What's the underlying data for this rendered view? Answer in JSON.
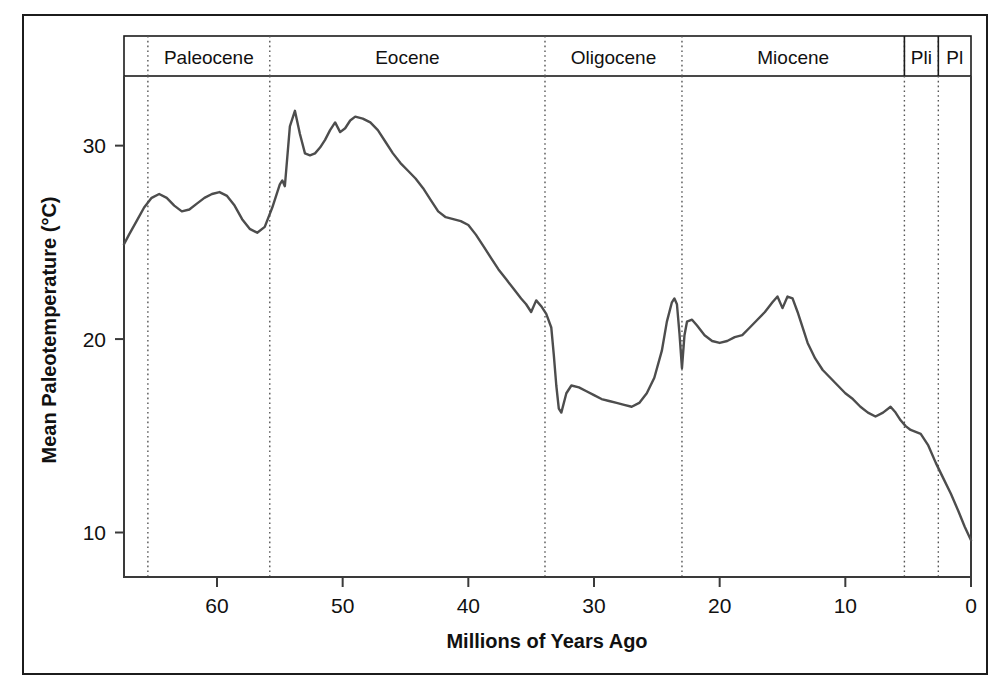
{
  "figure": {
    "background_color": "#ffffff",
    "frame_color": "#1c1c1c",
    "curve_color": "#4d4d4d",
    "axis_color": "#3a3a3a"
  },
  "chart_data": {
    "type": "line",
    "title": "",
    "xlabel": "Millions of Years Ago",
    "ylabel": "Mean Paleotemperature (°C)",
    "xlim": [
      67.4,
      0
    ],
    "ylim": [
      7.7,
      33.6
    ],
    "x_reversed": true,
    "grid": false,
    "legend": "none",
    "xticks": [
      60,
      50,
      40,
      30,
      20,
      10,
      0
    ],
    "xtick_labels": [
      "60",
      "50",
      "40",
      "30",
      "20",
      "10",
      "0"
    ],
    "yticks": [
      30,
      20,
      10
    ],
    "ytick_labels": [
      "30",
      "20",
      "10"
    ],
    "series": [
      {
        "name": "Mean Paleotemperature",
        "color": "#4d4d4d",
        "x": [
          67.4,
          67.0,
          66.4,
          65.8,
          65.2,
          64.6,
          64.0,
          63.4,
          62.8,
          62.2,
          61.6,
          61.0,
          60.4,
          59.8,
          59.2,
          58.6,
          58.0,
          57.4,
          56.8,
          56.2,
          55.6,
          55.2,
          55.0,
          54.8,
          54.6,
          54.2,
          53.8,
          53.4,
          53.0,
          52.6,
          52.2,
          51.8,
          51.4,
          51.0,
          50.6,
          50.2,
          49.8,
          49.4,
          49.0,
          48.4,
          47.8,
          47.2,
          46.6,
          46.0,
          45.4,
          44.8,
          44.2,
          43.6,
          43.0,
          42.4,
          41.8,
          41.2,
          40.6,
          40.0,
          39.4,
          38.8,
          38.2,
          37.6,
          37.0,
          36.4,
          35.8,
          35.4,
          35.0,
          34.6,
          34.2,
          33.8,
          33.4,
          33.2,
          33.0,
          32.8,
          32.6,
          32.2,
          31.8,
          31.2,
          30.6,
          30.0,
          29.4,
          28.8,
          28.2,
          27.6,
          27.0,
          26.4,
          25.8,
          25.2,
          24.6,
          24.2,
          23.8,
          23.6,
          23.4,
          23.2,
          23.0,
          22.8,
          22.6,
          22.2,
          21.8,
          21.2,
          20.6,
          20.0,
          19.4,
          18.8,
          18.2,
          17.6,
          17.0,
          16.4,
          15.8,
          15.4,
          15.0,
          14.6,
          14.2,
          13.8,
          13.4,
          13.0,
          12.4,
          11.8,
          11.2,
          10.6,
          10.0,
          9.4,
          8.8,
          8.2,
          7.6,
          7.0,
          6.4,
          6.0,
          5.6,
          5.2,
          4.8,
          4.4,
          4.0,
          3.4,
          2.8,
          2.2,
          1.6,
          1.0,
          0.5,
          0.0
        ],
        "y": [
          24.9,
          25.4,
          26.1,
          26.8,
          27.3,
          27.5,
          27.3,
          26.9,
          26.6,
          26.7,
          27.0,
          27.3,
          27.5,
          27.6,
          27.4,
          26.9,
          26.2,
          25.7,
          25.5,
          25.8,
          26.8,
          27.6,
          28.0,
          28.2,
          27.9,
          31.0,
          31.8,
          30.6,
          29.6,
          29.5,
          29.6,
          29.9,
          30.3,
          30.8,
          31.2,
          30.7,
          30.9,
          31.3,
          31.5,
          31.4,
          31.2,
          30.8,
          30.2,
          29.6,
          29.1,
          28.7,
          28.3,
          27.8,
          27.2,
          26.6,
          26.3,
          26.2,
          26.1,
          25.9,
          25.4,
          24.8,
          24.2,
          23.6,
          23.1,
          22.6,
          22.1,
          21.8,
          21.4,
          22.0,
          21.7,
          21.3,
          20.6,
          19.2,
          17.6,
          16.4,
          16.2,
          17.2,
          17.6,
          17.5,
          17.3,
          17.1,
          16.9,
          16.8,
          16.7,
          16.6,
          16.5,
          16.7,
          17.2,
          18.0,
          19.4,
          20.9,
          21.9,
          22.1,
          21.8,
          20.3,
          18.5,
          20.2,
          20.9,
          21.0,
          20.7,
          20.2,
          19.9,
          19.8,
          19.9,
          20.1,
          20.2,
          20.6,
          21.0,
          21.4,
          21.9,
          22.2,
          21.6,
          22.2,
          22.1,
          21.4,
          20.6,
          19.8,
          19.0,
          18.4,
          18.0,
          17.6,
          17.2,
          16.9,
          16.5,
          16.2,
          16.0,
          16.2,
          16.5,
          16.2,
          15.8,
          15.5,
          15.3,
          15.2,
          15.1,
          14.5,
          13.6,
          12.8,
          12.0,
          11.1,
          10.3,
          9.6
        ]
      }
    ],
    "epochs": [
      {
        "label": "Paleocene",
        "start_ma": 65.5,
        "end_ma": 55.8
      },
      {
        "label": "Eocene",
        "start_ma": 55.8,
        "end_ma": 33.9
      },
      {
        "label": "Oligocene",
        "start_ma": 33.9,
        "end_ma": 23.0
      },
      {
        "label": "Miocene",
        "start_ma": 23.0,
        "end_ma": 5.3
      },
      {
        "label": "Pli",
        "start_ma": 5.3,
        "end_ma": 2.6
      },
      {
        "label": "Pl",
        "start_ma": 2.6,
        "end_ma": 0.0
      }
    ],
    "epoch_boundaries_ma": [
      65.5,
      55.8,
      33.9,
      23.0,
      5.3,
      2.6
    ],
    "annotations": []
  }
}
